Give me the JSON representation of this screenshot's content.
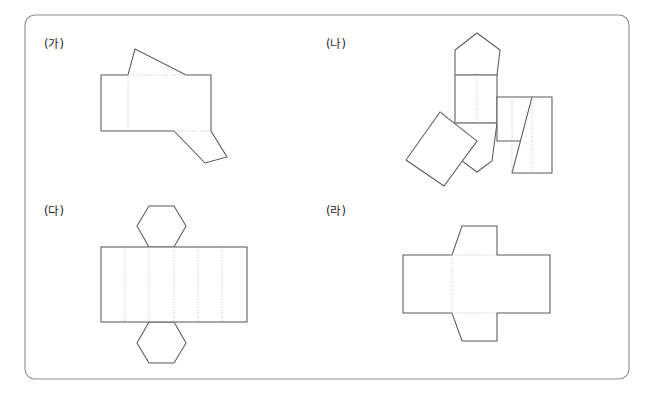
{
  "page": {
    "background_color": "#ffffff",
    "width": 649,
    "height": 394
  },
  "frame": {
    "name": "rounded-rectangle-border",
    "x": 25,
    "y": 15,
    "width": 604,
    "height": 364,
    "corner_radius": 10,
    "stroke_color": "#8d8d8d",
    "stroke_width": 1.1
  },
  "style": {
    "solid_stroke": "#5a5a5a",
    "fold_stroke": "#b9b9b9",
    "fill": "#ffffff",
    "label_color": "#1e1e1e",
    "label_font_size": 11.5
  },
  "figures": [
    {
      "id": "ga",
      "label": "(가)",
      "label_x": 44,
      "label_y": 48,
      "solid_name": "oblique-prism-net",
      "outline": "M 101,75 L 101,131 L 174,131 L 205,163 L 227,157 L 211,131 L 211,75 L 186,75 L 135,49 L 128,75 Z",
      "folds": [
        "M 128,75 L 128,131",
        "M 174,131 L 211,131",
        "M 128,75 L 211,75"
      ]
    },
    {
      "id": "na",
      "label": "(나)",
      "label_x": 326,
      "label_y": 48,
      "solid_name": "pentagonal-prism-net",
      "outline": "M 455,75 L 455,123 L 440,112 L 406,160 L 444,186 L 462,161 L 477,172 L 492,161 L 490,141 L 512,141 L 512,173 L 552,173 L 552,97 L 512,97 L 512,123 L 497,123 L 500,75 L 477,33 Z",
      "folds": [
        "M 455,75 L 497,75",
        "M 455,123 L 497,123",
        "M 477,123 L 477,75",
        "M 512,97 L 512,173",
        "M 532,97 L 532,173",
        "M 440,112 L 477,141"
      ],
      "parts": [
        {
          "name": "top-pentagon",
          "points": "455,75 455,50 477,33 500,50 497,75"
        },
        {
          "name": "center-square",
          "points": "455,75 497,75 497,123 455,123"
        },
        {
          "name": "bottom-pentagon",
          "points": "455,123 497,123 492,161 477,172 462,161"
        },
        {
          "name": "right-square-1",
          "points": "497,97 532,97 532,141 497,141"
        },
        {
          "name": "right-square-2",
          "points": "532,97 552,97 552,173 512,173"
        },
        {
          "name": "tilted-rectangle",
          "points": "440,112 477,141 444,186 406,160"
        }
      ]
    },
    {
      "id": "da",
      "label": "(다)",
      "label_x": 44,
      "label_y": 215,
      "solid_name": "hexagonal-prism-net",
      "rect": {
        "x": 101,
        "y": 247,
        "width": 146,
        "height": 75
      },
      "panel_count": 6,
      "folds": [
        "M 125,247 L 125,322",
        "M 149,247 L 149,322",
        "M 174,247 L 174,322",
        "M 198,247 L 198,322",
        "M 222,247 L 222,322",
        "M 149,247 L 174,247",
        "M 174,322 L 198,322"
      ],
      "top_hexagon": "149,247 137,226 149,206 174,206 186,226 174,247",
      "bottom_hexagon": "174,322 186,343 174,363 149,363 137,343 149,322"
    },
    {
      "id": "ra",
      "label": "(라)",
      "label_x": 326,
      "label_y": 215,
      "solid_name": "oblique-cube-net",
      "outline": "M 403,255 L 403,313 L 452,313 L 462,341 L 497,341 L 497,313 L 550,313 L 550,255 L 497,255 L 497,226 L 462,226 L 452,255 Z",
      "folds": [
        "M 452,255 L 497,255",
        "M 452,313 L 497,313",
        "M 452,255 L 452,313"
      ],
      "parts": [
        {
          "name": "left-square",
          "points": "403,255 452,255 452,313 403,313"
        },
        {
          "name": "center-square",
          "points": "452,255 497,255 497,313 452,313"
        },
        {
          "name": "right-square",
          "points": "497,255 550,255 550,313 497,313"
        },
        {
          "name": "top-trapezoid",
          "points": "452,255 462,226 497,226 497,255"
        },
        {
          "name": "bottom-trapezoid",
          "points": "452,313 497,313 497,341 462,341"
        }
      ]
    }
  ]
}
